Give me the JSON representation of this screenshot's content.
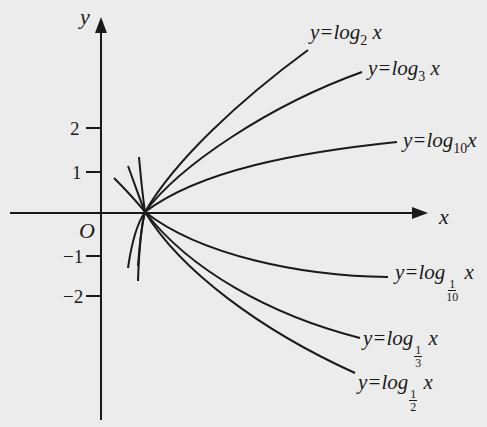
{
  "diagram": {
    "axes": {
      "x_label": "x",
      "y_label": "y",
      "origin_label": "O",
      "y_ticks": [
        {
          "value": 2,
          "label": "2"
        },
        {
          "value": 1,
          "label": "1"
        },
        {
          "value": -1,
          "label": "−1"
        },
        {
          "value": -2,
          "label": "−2"
        }
      ]
    },
    "curves": [
      {
        "id": "log2",
        "prefix": "y=log",
        "base": "2",
        "base_type": "sub",
        "suffix": "x"
      },
      {
        "id": "log3",
        "prefix": "y=log",
        "base": "3",
        "base_type": "sub",
        "suffix": "x"
      },
      {
        "id": "log10",
        "prefix": "y=log",
        "base": "10",
        "base_type": "sub",
        "suffix": "x"
      },
      {
        "id": "log1_10",
        "prefix": "y=log",
        "base_num": "1",
        "base_den": "10",
        "base_type": "frac",
        "suffix": "x"
      },
      {
        "id": "log1_3",
        "prefix": "y=log",
        "base_num": "1",
        "base_den": "3",
        "base_type": "frac",
        "suffix": "x"
      },
      {
        "id": "log1_2",
        "prefix": "y=log",
        "base_num": "1",
        "base_den": "2",
        "base_type": "frac",
        "suffix": "x"
      }
    ],
    "colors": {
      "background": "#ececec",
      "ink": "#1a1a1a"
    }
  }
}
